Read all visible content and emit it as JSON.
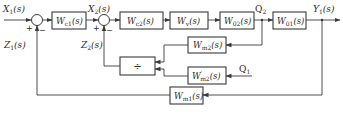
{
  "diagram": {
    "type": "control-block-diagram",
    "signals": {
      "input": "X1(s)",
      "intermediate": "X2(s)",
      "disturbance1": "Z1(s)",
      "disturbance2": "Z2(s)",
      "measured_flow2": "Q2",
      "measured_flow1": "Q1",
      "output": "Y1(s)"
    },
    "blocks": {
      "wc1": {
        "base": "W",
        "sub": "c1",
        "arg": "(s)"
      },
      "wc2": {
        "base": "W",
        "sub": "c2",
        "arg": "(s)"
      },
      "wv": {
        "base": "W",
        "sub": "v",
        "arg": "(s)"
      },
      "w02": {
        "base": "W",
        "sub": "02",
        "arg": "(s)"
      },
      "w01": {
        "base": "W",
        "sub": "01",
        "arg": "(s)"
      },
      "wm2": {
        "base": "W",
        "sub": "m2",
        "arg": "(s)"
      },
      "wm2p": {
        "base": "W",
        "sup": "′",
        "sub": "m2",
        "arg": "(s)"
      },
      "wm1": {
        "base": "W",
        "sub": "m1",
        "arg": "(s)"
      },
      "divider": {
        "symbol": "÷"
      }
    },
    "summing_junctions": [
      {
        "id": "sj1",
        "plus": "+",
        "minus": "−"
      },
      {
        "id": "sj2",
        "plus": "+",
        "minus": "−"
      }
    ],
    "labels": {
      "x1": {
        "base": "X",
        "sub": "1",
        "arg": "(s)"
      },
      "x2": {
        "base": "X",
        "sub": "2",
        "arg": "(s)"
      },
      "z1": {
        "base": "Z",
        "sub": "1",
        "arg": "(s)"
      },
      "z2": {
        "base": "Z",
        "sub": "2",
        "arg": "(s)"
      },
      "q2": {
        "base": "Q",
        "sub": "2"
      },
      "q1": {
        "base": "Q",
        "sub": "1"
      },
      "y1": {
        "base": "Y",
        "sub": "1",
        "arg": "(s)"
      }
    }
  }
}
